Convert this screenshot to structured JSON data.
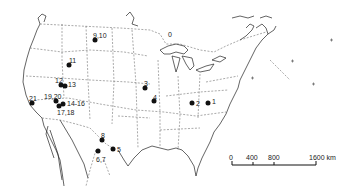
{
  "map": {
    "type": "locator map",
    "region": "United States and northern Mexico",
    "sites": [
      {
        "label": "1",
        "x": 208,
        "y": 103,
        "lx": 212,
        "ly": 98
      },
      {
        "label": "2",
        "x": 192,
        "y": 103,
        "lx": 196,
        "ly": 100
      },
      {
        "label": "3",
        "x": 145,
        "y": 88,
        "lx": 144,
        "ly": 80
      },
      {
        "label": "4",
        "x": 154,
        "y": 101,
        "lx": 153,
        "ly": 94
      },
      {
        "label": "5",
        "x": 113,
        "y": 149,
        "lx": 117,
        "ly": 146
      },
      {
        "label": "6,7",
        "x": 98,
        "y": 151,
        "lx": 96,
        "ly": 156
      },
      {
        "label": "8",
        "x": 102,
        "y": 140,
        "lx": 101,
        "ly": 132
      },
      {
        "label": "9,10",
        "x": 95,
        "y": 40,
        "lx": 93,
        "ly": 32
      },
      {
        "label": "11",
        "x": 69,
        "y": 65,
        "lx": 69,
        "ly": 57
      },
      {
        "label": "12",
        "x": 61,
        "y": 85,
        "lx": 55,
        "ly": 77
      },
      {
        "label": "13",
        "x": 65,
        "y": 86,
        "lx": 68,
        "ly": 81
      },
      {
        "label": "14-16",
        "x": 63,
        "y": 104,
        "lx": 67,
        "ly": 100
      },
      {
        "label": "17,18",
        "x": 59,
        "y": 106,
        "lx": 57,
        "ly": 109
      },
      {
        "label": "19,20",
        "x": 56,
        "y": 101,
        "lx": 44,
        "ly": 93
      },
      {
        "label": "21",
        "x": 32,
        "y": 103,
        "lx": 29,
        "ly": 95
      },
      {
        "label": "0",
        "x": 0,
        "y": 0,
        "lx": 168,
        "ly": 31,
        "text_only": true
      }
    ]
  },
  "scale_bar": {
    "ticks": [
      "0",
      "400",
      "800",
      "1600 km"
    ],
    "unit": "km"
  }
}
